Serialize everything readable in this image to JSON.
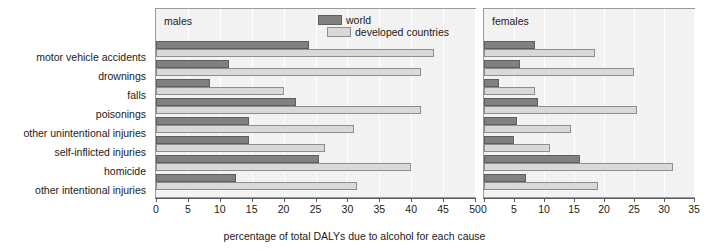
{
  "chart_data": {
    "type": "bar",
    "orientation": "horizontal",
    "title": "",
    "xlabel": "percentage of total DALYs due to alcohol for each cause",
    "ylabel": "",
    "grid": true,
    "legend_position": "top-right",
    "legend": [
      "world",
      "developed countries"
    ],
    "categories": [
      "motor vehicle accidents",
      "drownings",
      "falls",
      "poisonings",
      "other unintentional injuries",
      "self-inflicted injuries",
      "homicide",
      "other intentional injuries"
    ],
    "panels": [
      {
        "name": "males",
        "xlim": [
          0,
          50
        ],
        "xticks": [
          0,
          5,
          10,
          15,
          20,
          25,
          30,
          35,
          40,
          45,
          50
        ],
        "series": [
          {
            "name": "world",
            "values": [
              24,
              11.5,
              8.5,
              22,
              14.5,
              14.5,
              25.5,
              12.5
            ]
          },
          {
            "name": "developed countries",
            "values": [
              43.5,
              41.5,
              20,
              41.5,
              31,
              26.5,
              40,
              31.5
            ]
          }
        ]
      },
      {
        "name": "females",
        "xlim": [
          0,
          35
        ],
        "xticks": [
          0,
          5,
          10,
          15,
          20,
          25,
          30,
          35
        ],
        "series": [
          {
            "name": "world",
            "values": [
              8.5,
              6,
              2.5,
              9,
              5.5,
              5,
              16,
              7
            ]
          },
          {
            "name": "developed countries",
            "values": [
              18.5,
              25,
              8.5,
              25.5,
              14.5,
              11,
              31.5,
              19
            ]
          }
        ]
      }
    ],
    "colors": {
      "world": "#808080",
      "developed_countries": "#d9d9d9",
      "panel_background": "#f2f2f2",
      "gridline": "#ffffff",
      "axis": "#5a5a5a",
      "text": "#1a1a1a"
    }
  }
}
